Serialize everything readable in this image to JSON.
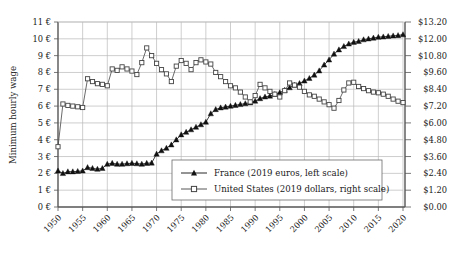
{
  "chart_data": {
    "type": "line",
    "title": "",
    "xlabel": "",
    "ylabel": "Minimum hourly wage",
    "y2label": "",
    "grid": true,
    "legend_position": "bottom-center",
    "xlim": [
      1950,
      2020
    ],
    "ylim": [
      0,
      11
    ],
    "y2lim": [
      0.0,
      13.2
    ],
    "xticks": [
      "1950",
      "1955",
      "1960",
      "1965",
      "1970",
      "1975",
      "1980",
      "1985",
      "1990",
      "1995",
      "2000",
      "2005",
      "2010",
      "2015",
      "2020"
    ],
    "yticks": [
      "0 €",
      "1 €",
      "2 €",
      "3 €",
      "4 €",
      "5 €",
      "6 €",
      "7 €",
      "8 €",
      "9 €",
      "10 €",
      "11 €"
    ],
    "y2ticks": [
      "$0.00",
      "$1.20",
      "$2.40",
      "$3.60",
      "$4.80",
      "$6.00",
      "$7.20",
      "$8.40",
      "$9.60",
      "$10.80",
      "$12.00",
      "$13.20"
    ],
    "x": [
      1950,
      1951,
      1952,
      1953,
      1954,
      1955,
      1956,
      1957,
      1958,
      1959,
      1960,
      1961,
      1962,
      1963,
      1964,
      1965,
      1966,
      1967,
      1968,
      1969,
      1970,
      1971,
      1972,
      1973,
      1974,
      1975,
      1976,
      1977,
      1978,
      1979,
      1980,
      1981,
      1982,
      1983,
      1984,
      1985,
      1986,
      1987,
      1988,
      1989,
      1990,
      1991,
      1992,
      1993,
      1994,
      1995,
      1996,
      1997,
      1998,
      1999,
      2000,
      2001,
      2002,
      2003,
      2004,
      2005,
      2006,
      2007,
      2008,
      2009,
      2010,
      2011,
      2012,
      2013,
      2014,
      2015,
      2016,
      2017,
      2018,
      2019,
      2020
    ],
    "series": [
      {
        "name": "France (2019 euros, left scale)",
        "unit": "€",
        "scale": "left",
        "marker": "filled-triangle",
        "values": [
          2.15,
          2.0,
          2.1,
          2.1,
          2.12,
          2.15,
          2.35,
          2.3,
          2.25,
          2.3,
          2.55,
          2.6,
          2.55,
          2.55,
          2.58,
          2.6,
          2.58,
          2.55,
          2.6,
          2.62,
          3.15,
          3.35,
          3.5,
          3.7,
          4.0,
          4.3,
          4.45,
          4.6,
          4.75,
          4.9,
          5.05,
          5.55,
          5.8,
          5.9,
          5.95,
          6.0,
          6.05,
          6.1,
          6.15,
          6.2,
          6.3,
          6.45,
          6.55,
          6.6,
          6.7,
          6.8,
          6.95,
          7.1,
          7.25,
          7.35,
          7.5,
          7.65,
          7.85,
          8.1,
          8.45,
          8.75,
          9.1,
          9.35,
          9.55,
          9.7,
          9.8,
          9.85,
          9.95,
          10.0,
          10.05,
          10.1,
          10.12,
          10.15,
          10.18,
          10.2,
          10.25
        ]
      },
      {
        "name": "United States (2019 dollars, right scale)",
        "unit": "$",
        "scale": "right",
        "marker": "open-square",
        "values": [
          4.3,
          7.35,
          7.25,
          7.2,
          7.15,
          7.1,
          9.15,
          8.95,
          8.8,
          8.75,
          8.65,
          9.85,
          9.75,
          10.0,
          9.85,
          9.7,
          9.45,
          10.3,
          11.35,
          10.8,
          10.25,
          9.8,
          9.5,
          8.95,
          10.05,
          10.45,
          10.25,
          9.8,
          10.3,
          10.5,
          10.35,
          10.2,
          9.6,
          9.3,
          8.95,
          8.65,
          8.5,
          8.2,
          7.85,
          7.5,
          7.95,
          8.75,
          8.5,
          8.25,
          8.05,
          7.85,
          8.3,
          8.85,
          8.7,
          8.55,
          8.25,
          8.0,
          7.9,
          7.7,
          7.5,
          7.3,
          7.05,
          7.6,
          8.35,
          8.85,
          8.9,
          8.6,
          8.45,
          8.3,
          8.2,
          8.15,
          8.05,
          7.9,
          7.7,
          7.55,
          7.45
        ]
      }
    ]
  },
  "axes": {
    "y_label": "Minimum hourly wage"
  },
  "legend": {
    "items": [
      {
        "label": "France (2019 euros, left scale)",
        "marker": "filled-triangle"
      },
      {
        "label": "United States (2019 dollars, right scale)",
        "marker": "open-square"
      }
    ]
  },
  "colors": {
    "series_france": "#111111",
    "series_us": "#444444",
    "grid": "#b9b9b9",
    "axis": "#555555",
    "background": "#ffffff"
  }
}
